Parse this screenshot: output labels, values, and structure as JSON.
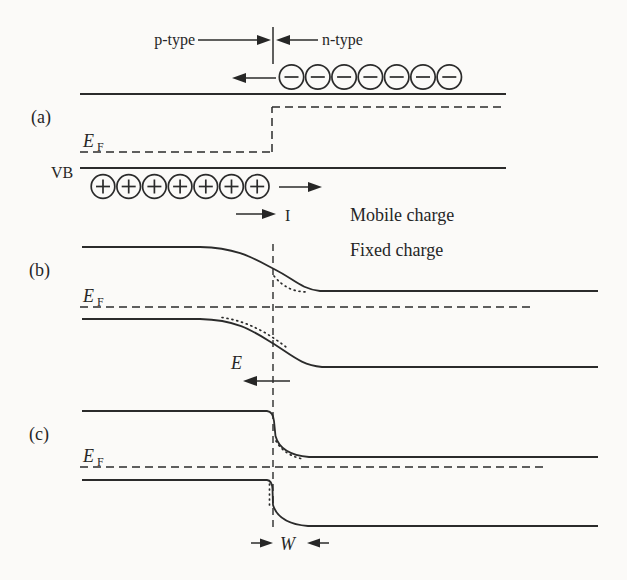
{
  "colors": {
    "background": "#fbfaf8",
    "ink": "#2b2b2b"
  },
  "panel_a": {
    "label": "(a)",
    "p_region_label": "p-type",
    "n_region_label": "n-type",
    "fermi_label": "E",
    "fermi_sub": "F",
    "valence_band_label": "VB",
    "electron_count": 7,
    "hole_count": 7,
    "electron_symbol": "minus-in-circle",
    "hole_symbol": "plus-in-circle"
  },
  "legend": {
    "current_label": "I",
    "mobile_label": "Mobile charge",
    "fixed_label": "Fixed charge"
  },
  "panel_b": {
    "label": "(b)",
    "fermi_label": "E",
    "fermi_sub": "F",
    "field_label": "E"
  },
  "panel_c": {
    "label": "(c)",
    "fermi_label": "E",
    "fermi_sub": "F",
    "depletion_width_label": "W"
  }
}
